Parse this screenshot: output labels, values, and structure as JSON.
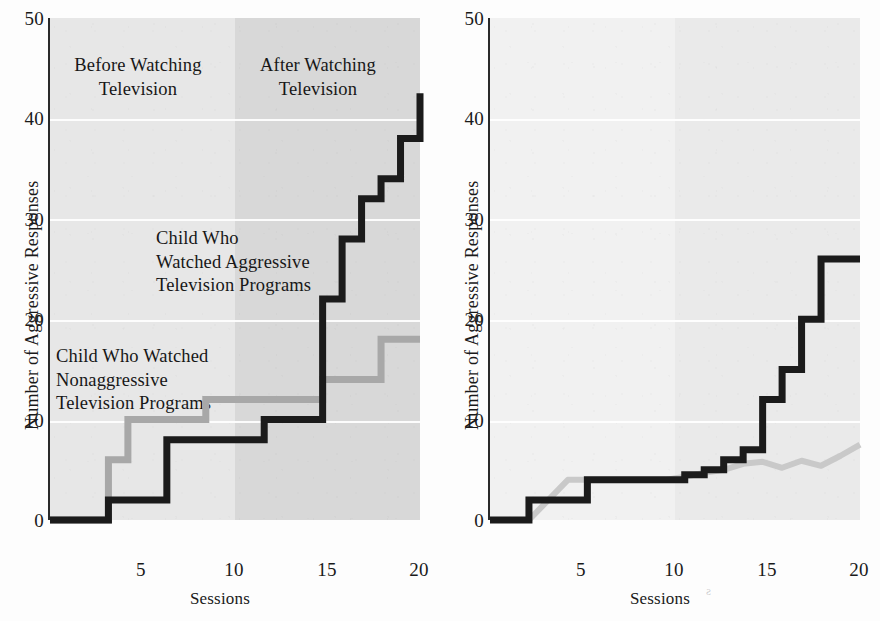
{
  "axes": {
    "ylabel": "Number of Aggressive Responses",
    "xlabel": "Sessions",
    "yticks": [
      "0",
      "10",
      "20",
      "30",
      "40",
      "50"
    ],
    "xticks": [
      "5",
      "10",
      "15",
      "20"
    ],
    "ylim": [
      0,
      50
    ],
    "xlim": [
      1,
      20
    ]
  },
  "colors": {
    "aggressive_line": "#1b1b1b",
    "nonaggressive_line": "#a8a8a8",
    "band_before_left": "#e7e7e7",
    "band_after_left": "#d8d8d8",
    "band_before_right": "#f1f1f1",
    "band_after_right": "#eaeaea",
    "gridline": "#ffffff"
  },
  "panels": {
    "left": {
      "annotations": {
        "before": "Before Watching\nTelevision",
        "after": "After Watching\nTelevision",
        "aggressive": "Child Who\nWatched Aggressive\nTelevision Programs",
        "nonaggressive": "Child Who Watched\nNonaggressive\nTelevision Programs"
      }
    },
    "right": {
      "annotations": {}
    }
  },
  "bleed_text": "s",
  "chart_data": [
    {
      "id": "left",
      "type": "line",
      "title": "",
      "xlabel": "Sessions",
      "ylabel": "Number of Aggressive Responses",
      "xlim": [
        1,
        20
      ],
      "ylim": [
        0,
        50
      ],
      "grid": true,
      "gridlines_y": [
        10,
        20,
        30,
        40
      ],
      "legend": "in-plot annotations",
      "shaded_regions": [
        {
          "label": "Before Watching Television",
          "x_range": [
            1,
            10
          ]
        },
        {
          "label": "After Watching Television",
          "x_range": [
            10,
            20
          ]
        }
      ],
      "x": [
        1,
        2,
        3,
        4,
        5,
        6,
        7,
        8,
        9,
        10,
        11,
        12,
        13,
        14,
        15,
        16,
        17,
        18,
        19,
        20
      ],
      "series": [
        {
          "name": "Child Who Watched Aggressive Television Programs",
          "color": "#1b1b1b",
          "values": [
            0,
            0,
            0,
            2,
            2,
            2,
            8,
            8,
            8,
            8,
            8,
            10,
            10,
            10,
            22,
            28,
            32,
            34,
            38,
            42.5
          ]
        },
        {
          "name": "Child Who Watched Nonaggressive Television Programs",
          "color": "#a8a8a8",
          "values": [
            0,
            0,
            0,
            6,
            10,
            10,
            10,
            10,
            12,
            12,
            12,
            12,
            12,
            12,
            14,
            14,
            14,
            18,
            18,
            18
          ]
        }
      ]
    },
    {
      "id": "right",
      "type": "line",
      "title": "",
      "xlabel": "Sessions",
      "ylabel": "Number of Aggressive Responses",
      "xlim": [
        1,
        20
      ],
      "ylim": [
        0,
        50
      ],
      "grid": true,
      "gridlines_y": [
        10,
        20,
        30,
        40
      ],
      "shaded_regions": [
        {
          "label": "Before Watching Television",
          "x_range": [
            1,
            10
          ]
        },
        {
          "label": "After Watching Television",
          "x_range": [
            10,
            20
          ]
        }
      ],
      "x": [
        1,
        2,
        3,
        4,
        5,
        6,
        7,
        8,
        9,
        10,
        11,
        12,
        13,
        14,
        15,
        16,
        17,
        18,
        19,
        20
      ],
      "series": [
        {
          "name": "Child Who Watched Aggressive Television Programs",
          "color": "#1b1b1b",
          "values": [
            0,
            0,
            2,
            2,
            2,
            4,
            4,
            4,
            4,
            4,
            4.5,
            5,
            6,
            7,
            12,
            15,
            20,
            26,
            26,
            26
          ]
        },
        {
          "name": "Child Who Watched Nonaggressive Television Programs",
          "color": "#c9c9c9",
          "values": [
            0,
            0,
            0,
            2,
            4,
            4,
            4,
            4,
            4,
            4,
            4.3,
            4.7,
            5,
            5.6,
            5.8,
            5.2,
            5.9,
            5.4,
            6.4,
            7.5
          ]
        }
      ]
    }
  ]
}
